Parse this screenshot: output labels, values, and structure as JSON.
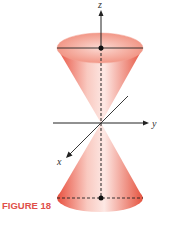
{
  "figure": {
    "caption": "FIGURE 18",
    "axes": {
      "z_label": "z",
      "y_label": "y",
      "x_label": "x"
    },
    "colors": {
      "cone_dark": "#e8503f",
      "cone_light": "#fde8e4",
      "axis": "#222222",
      "caption": "#e0504a"
    }
  }
}
